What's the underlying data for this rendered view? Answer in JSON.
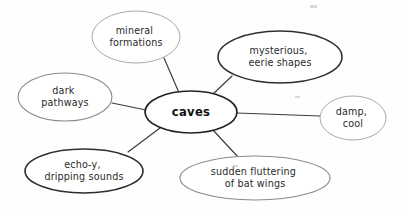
{
  "diagram": {
    "type": "concept-web",
    "title": "caves",
    "background_color": "#fefefe",
    "edge_color": "#3a3a3a",
    "center": {
      "id": "caves",
      "label": "caves",
      "lines": [
        "caves"
      ],
      "cx": 191,
      "cy": 112,
      "rx": 46,
      "ry": 21,
      "weight": "center"
    },
    "branches": [
      {
        "id": "mineral-formations",
        "label": "mineral formations",
        "lines": [
          "mineral",
          "formations"
        ],
        "cx": 136,
        "cy": 37,
        "rx": 44,
        "ry": 26,
        "weight": "light",
        "edge": {
          "x1": 164,
          "y1": 58,
          "x2": 180,
          "y2": 95
        }
      },
      {
        "id": "mysterious-eerie-shapes",
        "label": "mysterious, eerie shapes",
        "lines": [
          "mysterious,",
          "eerie shapes"
        ],
        "cx": 280,
        "cy": 57,
        "rx": 62,
        "ry": 26,
        "weight": "dark",
        "edge": {
          "x1": 232,
          "y1": 76,
          "x2": 213,
          "y2": 94
        }
      },
      {
        "id": "dark-pathways",
        "label": "dark pathways",
        "lines": [
          "dark",
          "pathways"
        ],
        "cx": 65,
        "cy": 97,
        "rx": 47,
        "ry": 24,
        "weight": "medium",
        "edge": {
          "x1": 112,
          "y1": 103,
          "x2": 146,
          "y2": 110
        }
      },
      {
        "id": "damp-cool",
        "label": "damp, cool",
        "lines": [
          "damp,",
          "cool"
        ],
        "cx": 353,
        "cy": 118,
        "rx": 33,
        "ry": 22,
        "weight": "light",
        "edge": {
          "x1": 320,
          "y1": 116,
          "x2": 237,
          "y2": 112
        }
      },
      {
        "id": "echoy-dripping-sounds",
        "label": "echo-y, dripping sounds",
        "lines": [
          "echo-y,",
          "dripping sounds"
        ],
        "cx": 84,
        "cy": 171,
        "rx": 59,
        "ry": 22,
        "weight": "dark",
        "edge": {
          "x1": 128,
          "y1": 152,
          "x2": 160,
          "y2": 128
        }
      },
      {
        "id": "sudden-fluttering-bat-wings",
        "label": "sudden fluttering of bat wings",
        "lines": [
          "sudden fluttering",
          "of bat wings"
        ],
        "cx": 255,
        "cy": 178,
        "rx": 75,
        "ry": 22,
        "weight": "medium",
        "edge": {
          "x1": 238,
          "y1": 157,
          "x2": 212,
          "y2": 129
        }
      }
    ]
  }
}
